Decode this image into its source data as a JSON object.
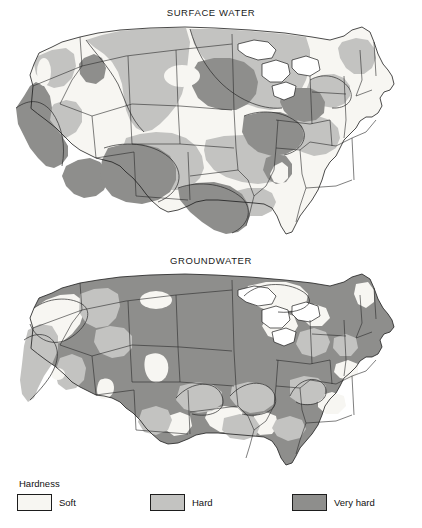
{
  "figure": {
    "type": "choropleth-map-pair",
    "background_color": "#ffffff"
  },
  "panels": [
    {
      "id": "surface-water",
      "title": "SURFACE WATER",
      "dominant_class": "Hard"
    },
    {
      "id": "groundwater",
      "title": "GROUNDWATER",
      "dominant_class": "Very hard"
    }
  ],
  "legend": {
    "title": "Hardness",
    "items": [
      {
        "label": "Soft",
        "color": "#f7f6f2"
      },
      {
        "label": "Hard",
        "color": "#c3c3c1"
      },
      {
        "label": "Very hard",
        "color": "#8e8e8c"
      }
    ]
  },
  "colors": {
    "soft": "#f7f6f2",
    "hard": "#c3c3c1",
    "very_hard": "#8e8e8c",
    "outline": "#1d1d1d",
    "text": "#111111"
  }
}
